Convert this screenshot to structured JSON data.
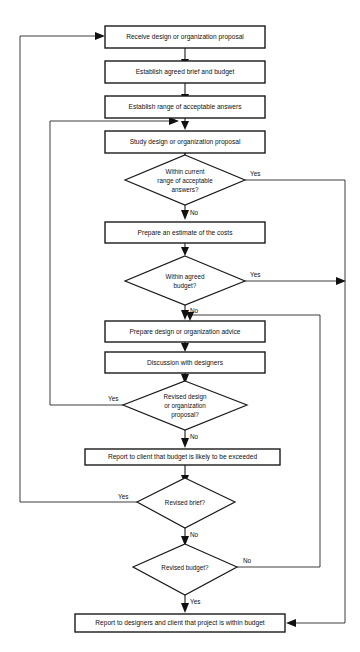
{
  "diagram": {
    "type": "flowchart",
    "background_color": "#ffffff",
    "line_color": "#1a1a1a",
    "text_color": "#111111"
  },
  "nodes": [
    {
      "id": "receive",
      "kind": "process",
      "text": "Receive design or organization proposal"
    },
    {
      "id": "establish-brief",
      "kind": "process",
      "text": "Establish agreed brief and budget"
    },
    {
      "id": "establish-range",
      "kind": "process",
      "text": "Establish range of acceptable answers"
    },
    {
      "id": "study",
      "kind": "process",
      "text": "Study design or organization proposal"
    },
    {
      "id": "within-range",
      "kind": "decision",
      "line1": "Within current",
      "line2": "range of acceptable",
      "line3": "answers?"
    },
    {
      "id": "prepare-estimate",
      "kind": "process",
      "text": "Prepare an estimate of the costs"
    },
    {
      "id": "within-budget",
      "kind": "decision",
      "line1": "Within agreed",
      "line2": "budget?",
      "line3": ""
    },
    {
      "id": "prepare-advice",
      "kind": "process",
      "text": "Prepare design or organization advice"
    },
    {
      "id": "discussion",
      "kind": "process",
      "text": "Discussion with designers"
    },
    {
      "id": "revised-design",
      "kind": "decision",
      "line1": "Revised design",
      "line2": "or organization",
      "line3": "proposal?"
    },
    {
      "id": "report-exceeded",
      "kind": "process",
      "text": "Report to client that budget is likely to be exceeded"
    },
    {
      "id": "revised-brief",
      "kind": "decision",
      "line1": "Revised brief?",
      "line2": "",
      "line3": ""
    },
    {
      "id": "revised-budget",
      "kind": "decision",
      "line1": "Revised budget?",
      "line2": "",
      "line3": ""
    },
    {
      "id": "report-within",
      "kind": "process",
      "text": "Report to designers and client that project is within budget"
    }
  ],
  "edge_labels": {
    "within_range_yes": "Yes",
    "within_range_no": "No",
    "within_budget_yes": "Yes",
    "within_budget_no": "No",
    "revised_design_yes": "Yes",
    "revised_design_no": "No",
    "revised_brief_yes": "Yes",
    "revised_brief_no": "No",
    "revised_budget_no": "No",
    "revised_budget_yes": "Yes"
  }
}
